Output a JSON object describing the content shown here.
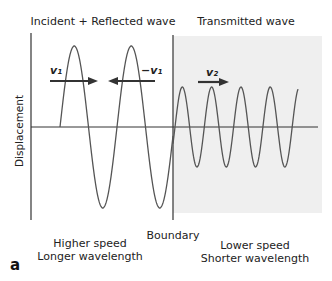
{
  "titles": {
    "left": "Incident + Reflected wave",
    "right": "Transmitted wave"
  },
  "axis": {
    "ylabel": "Displacement"
  },
  "velocities": {
    "incident": "v₁",
    "reflected": "−v₁",
    "transmitted": "v₂"
  },
  "boundary_label": "Boundary",
  "regions": {
    "left": {
      "line1": "Higher speed",
      "line2": "Longer wavelength"
    },
    "right": {
      "line1": "Lower speed",
      "line2": "Shorter wavelength"
    }
  },
  "panel_label": "a",
  "colors": {
    "wave": "#555555",
    "axis": "#333333",
    "arrow": "#333333",
    "shade": "#efefef"
  }
}
